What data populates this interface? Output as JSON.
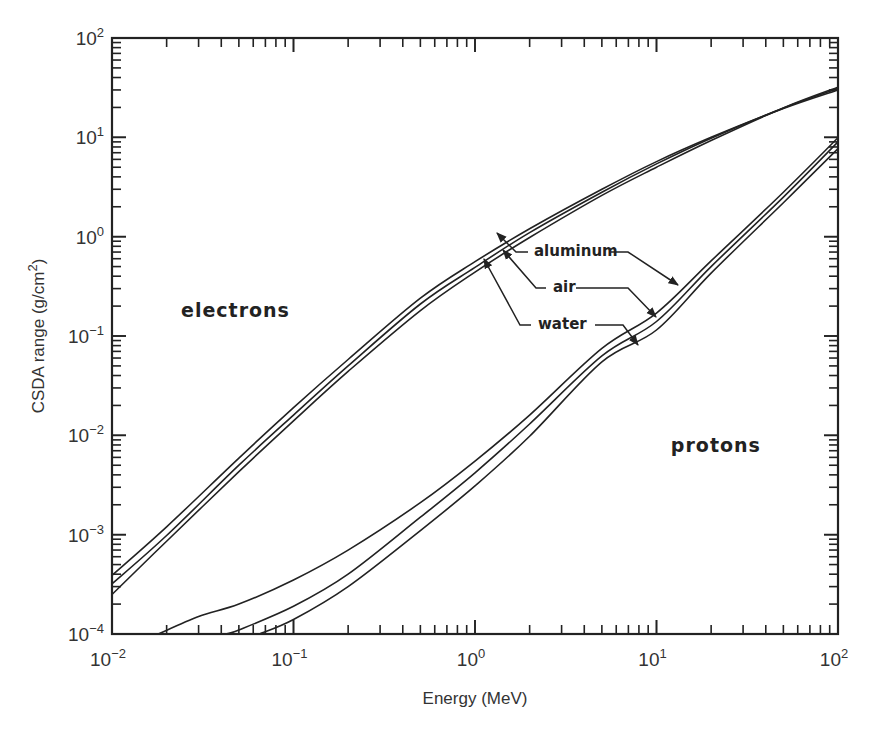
{
  "chart_data": {
    "type": "line",
    "title": "",
    "xlabel": "Energy (MeV)",
    "ylabel": "CSDA range (g/cm²)",
    "xscale": "log",
    "yscale": "log",
    "xlim": [
      0.01,
      100
    ],
    "ylim": [
      0.0001,
      100
    ],
    "grid": false,
    "legend": "none (inline annotations)",
    "x_ticks": [
      {
        "base": "10",
        "exp": "-2",
        "value": 0.01
      },
      {
        "base": "10",
        "exp": "-1",
        "value": 0.1
      },
      {
        "base": "10",
        "exp": "0",
        "value": 1
      },
      {
        "base": "10",
        "exp": "1",
        "value": 10
      },
      {
        "base": "10",
        "exp": "2",
        "value": 100
      }
    ],
    "y_ticks": [
      {
        "base": "10",
        "exp": "-4",
        "value": 0.0001
      },
      {
        "base": "10",
        "exp": "-3",
        "value": 0.001
      },
      {
        "base": "10",
        "exp": "-2",
        "value": 0.01
      },
      {
        "base": "10",
        "exp": "-1",
        "value": 0.1
      },
      {
        "base": "10",
        "exp": "0",
        "value": 1
      },
      {
        "base": "10",
        "exp": "1",
        "value": 10
      },
      {
        "base": "10",
        "exp": "2",
        "value": 100
      }
    ],
    "group_labels": [
      {
        "text": "electrons",
        "x_energy": 0.024,
        "y_range": 0.155
      },
      {
        "text": "protons",
        "x_energy": 12.0,
        "y_range": 0.0068
      }
    ],
    "annotations": [
      {
        "text": "aluminum",
        "x_energy": 4.5,
        "y_range": 0.85
      },
      {
        "text": "air",
        "x_energy": 4.0,
        "y_range": 0.3
      },
      {
        "text": "water",
        "x_energy": 4.0,
        "y_range": 0.1
      }
    ],
    "series": [
      {
        "name": "electrons - aluminum",
        "particle": "electrons",
        "material": "aluminum",
        "x": [
          0.01,
          0.02,
          0.05,
          0.1,
          0.2,
          0.5,
          1,
          2,
          5,
          10,
          20,
          50,
          100
        ],
        "y": [
          0.00039,
          0.0012,
          0.0059,
          0.019,
          0.058,
          0.24,
          0.56,
          1.2,
          3.0,
          5.7,
          10.0,
          19.5,
          30
        ]
      },
      {
        "name": "electrons - air",
        "particle": "electrons",
        "material": "air",
        "x": [
          0.01,
          0.02,
          0.05,
          0.1,
          0.2,
          0.5,
          1,
          2,
          5,
          10,
          20,
          50,
          100
        ],
        "y": [
          0.00032,
          0.00098,
          0.005,
          0.016,
          0.05,
          0.21,
          0.49,
          1.1,
          2.8,
          5.4,
          9.8,
          19.7,
          31
        ]
      },
      {
        "name": "electrons - water",
        "particle": "electrons",
        "material": "water",
        "x": [
          0.01,
          0.02,
          0.05,
          0.1,
          0.2,
          0.5,
          1,
          2,
          5,
          10,
          20,
          50,
          100
        ],
        "y": [
          0.00025,
          0.00086,
          0.0043,
          0.014,
          0.044,
          0.18,
          0.44,
          0.98,
          2.6,
          5.0,
          9.3,
          19.8,
          32
        ]
      },
      {
        "name": "protons - aluminum",
        "particle": "protons",
        "material": "aluminum",
        "x": [
          0.018,
          0.03,
          0.05,
          0.1,
          0.2,
          0.5,
          1,
          2,
          5,
          10,
          20,
          50,
          100
        ],
        "y": [
          0.0001,
          0.00015,
          0.0002,
          0.00035,
          0.0007,
          0.0021,
          0.0055,
          0.016,
          0.075,
          0.17,
          0.57,
          2.8,
          9.9
        ]
      },
      {
        "name": "protons - air",
        "particle": "protons",
        "material": "air",
        "x": [
          0.042,
          0.05,
          0.1,
          0.2,
          0.5,
          1,
          2,
          5,
          10,
          20,
          50,
          100
        ],
        "y": [
          0.0001,
          0.00011,
          0.00019,
          0.0004,
          0.0015,
          0.0042,
          0.013,
          0.063,
          0.14,
          0.5,
          2.5,
          9.0
        ]
      },
      {
        "name": "protons - water",
        "particle": "protons",
        "material": "water",
        "x": [
          0.065,
          0.1,
          0.2,
          0.5,
          1,
          2,
          5,
          10,
          20,
          50,
          100
        ],
        "y": [
          0.0001,
          0.00014,
          0.0003,
          0.0011,
          0.0031,
          0.0098,
          0.055,
          0.115,
          0.43,
          2.2,
          7.7
        ]
      }
    ]
  },
  "colors": {
    "line": "#222222",
    "axis": "#222222",
    "background": "#ffffff"
  }
}
